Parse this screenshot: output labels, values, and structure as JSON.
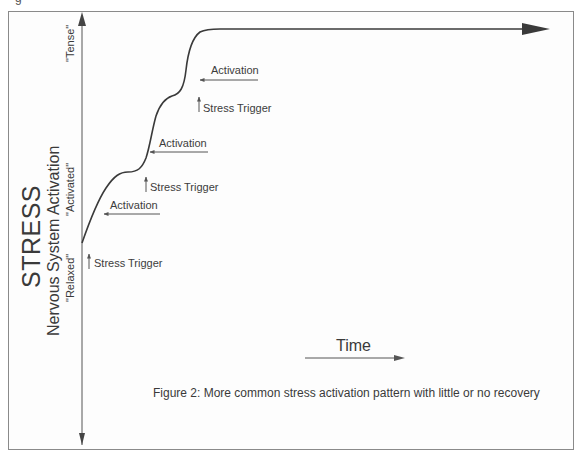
{
  "figure": {
    "caption": "Figure 2: More common stress activation pattern with little or no recovery",
    "cut_glyph": "g"
  },
  "y_axis": {
    "title": "STRESS",
    "subtitle": "Nervous System Activation",
    "levels": [
      "\"Relaxed\"",
      "\"Activated\"",
      "\"Tense\""
    ]
  },
  "x_axis": {
    "label": "Time"
  },
  "annotations": {
    "stress_triggers": [
      "Stress Trigger",
      "Stress Trigger",
      "Stress Trigger"
    ],
    "activations": [
      "Activation",
      "Activation",
      "Activation"
    ]
  },
  "colors": {
    "line": "#3a3a3a",
    "arrow": "#444444",
    "frame": "#8a8a8a",
    "text": "#3c3c3c"
  }
}
